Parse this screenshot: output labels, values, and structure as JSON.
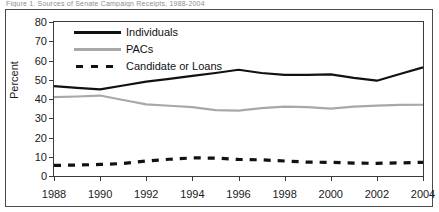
{
  "figure": {
    "caption_cropped": "Figure 1.  Sources of Senate Campaign Receipts, 1988-2004",
    "ylabel": "Percent"
  },
  "legend": {
    "position": "inside-top-left",
    "items": [
      {
        "label": "Individuals",
        "style": "solid",
        "color": "#111111"
      },
      {
        "label": "PACs",
        "style": "solid",
        "color": "#a8a8a8"
      },
      {
        "label": "Candidate or Loans",
        "style": "dashed",
        "color": "#111111"
      }
    ]
  },
  "chart_data": {
    "type": "line",
    "title": "",
    "xlabel": "",
    "ylabel": "Percent",
    "ylim": [
      0,
      80
    ],
    "ytick_step": 10,
    "yticks": [
      0,
      10,
      20,
      30,
      40,
      50,
      60,
      70,
      80
    ],
    "grid": false,
    "xlim": [
      1988,
      2004
    ],
    "x": [
      1988,
      1989,
      1990,
      1991,
      1992,
      1993,
      1994,
      1995,
      1996,
      1997,
      1998,
      1999,
      2000,
      2001,
      2002,
      2003,
      2004
    ],
    "xtick_labels": [
      "1988",
      "1990",
      "1992",
      "1994",
      "1996",
      "1998",
      "2000",
      "2002",
      "2004"
    ],
    "xticks": [
      1988,
      1990,
      1992,
      1994,
      1996,
      1998,
      2000,
      2002,
      2004
    ],
    "series": [
      {
        "name": "Individuals",
        "color": "#111111",
        "style": "solid",
        "values": [
          46.7,
          45.8,
          45.0,
          47.0,
          49.0,
          50.5,
          52.0,
          53.5,
          55.2,
          53.5,
          52.5,
          52.5,
          52.8,
          51.0,
          49.5,
          53.0,
          56.4
        ]
      },
      {
        "name": "PACs",
        "color": "#a8a8a8",
        "style": "solid",
        "values": [
          41.0,
          41.3,
          41.8,
          39.5,
          37.2,
          36.5,
          35.8,
          34.2,
          34.0,
          35.3,
          36.0,
          35.8,
          35.0,
          36.0,
          36.6,
          36.9,
          37.0
        ]
      },
      {
        "name": "Candidate or Loans",
        "color": "#111111",
        "style": "dashed",
        "values": [
          5.5,
          5.7,
          6.0,
          6.5,
          7.8,
          8.7,
          9.4,
          9.3,
          8.6,
          8.4,
          7.8,
          7.2,
          7.1,
          6.7,
          6.6,
          6.8,
          7.1
        ]
      }
    ],
    "series_dashed_extra": {
      "name": "Candidate or Loans",
      "values_late": [
        7.2,
        7.8,
        8.5,
        9.4,
        9.5,
        7.8,
        6.0
      ]
    }
  }
}
